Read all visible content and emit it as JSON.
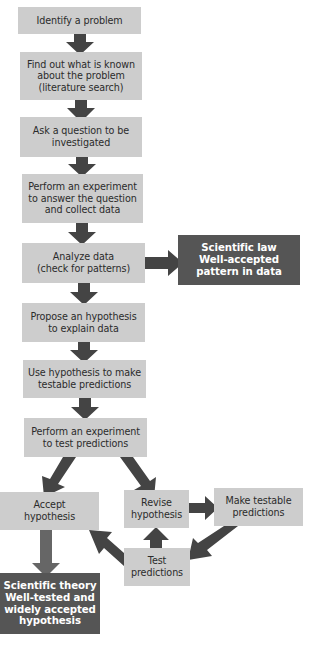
{
  "diagram": {
    "colors": {
      "step_box": "#cdcdcd",
      "result_box": "#555555",
      "arrow": "#444444",
      "text": "#2b2b2b",
      "result_text": "#ffffff"
    },
    "steps": [
      {
        "id": "identify",
        "label": "Identify a problem"
      },
      {
        "id": "find-out",
        "label": "Find out what is known\nabout the problem\n(literature search)"
      },
      {
        "id": "ask",
        "label": "Ask a question to be\ninvestigated"
      },
      {
        "id": "experiment-1",
        "label": "Perform an experiment\nto answer the question\nand collect data"
      },
      {
        "id": "analyze",
        "label": "Analyze data\n(check for patterns)"
      },
      {
        "id": "propose",
        "label": "Propose an hypothesis\nto explain data"
      },
      {
        "id": "use-hypothesis",
        "label": "Use hypothesis to make\ntestable predictions"
      },
      {
        "id": "experiment-2",
        "label": "Perform an experiment\nto test predictions"
      },
      {
        "id": "accept",
        "label": "Accept\nhypothesis"
      },
      {
        "id": "revise",
        "label": "Revise\nhypothesis"
      },
      {
        "id": "make-testable",
        "label": "Make testable\npredictions"
      },
      {
        "id": "test",
        "label": "Test\npredictions"
      }
    ],
    "results": [
      {
        "id": "law",
        "label": "Scientific law\nWell-accepted\npattern in data"
      },
      {
        "id": "theory",
        "label": "Scientific theory\nWell-tested and\nwidely accepted\nhypothesis"
      }
    ],
    "edges": [
      [
        "identify",
        "find-out"
      ],
      [
        "find-out",
        "ask"
      ],
      [
        "ask",
        "experiment-1"
      ],
      [
        "experiment-1",
        "analyze"
      ],
      [
        "analyze",
        "law"
      ],
      [
        "analyze",
        "propose"
      ],
      [
        "propose",
        "use-hypothesis"
      ],
      [
        "use-hypothesis",
        "experiment-2"
      ],
      [
        "experiment-2",
        "accept"
      ],
      [
        "experiment-2",
        "revise"
      ],
      [
        "revise",
        "make-testable"
      ],
      [
        "make-testable",
        "test"
      ],
      [
        "test",
        "revise"
      ],
      [
        "test",
        "accept"
      ],
      [
        "accept",
        "theory"
      ]
    ]
  }
}
